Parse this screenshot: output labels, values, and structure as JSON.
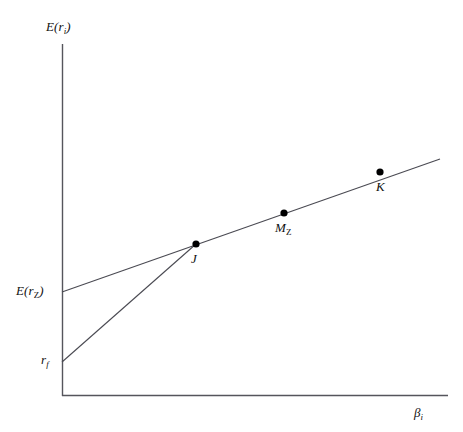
{
  "figure": {
    "background": "#ffffff",
    "line_color": "#4a4a52",
    "axis_color": "#55555c",
    "point_color": "#000000",
    "width": 463,
    "height": 432
  },
  "axes": {
    "y_label": "E(r",
    "y_label_sub": "i",
    "y_label_close": ")",
    "x_label": "β",
    "x_label_sub": "i",
    "origin": {
      "x": 62,
      "y": 396
    },
    "y_top": 44,
    "x_right": 448
  },
  "labels": {
    "erz_main": "E(r",
    "erz_sub": "Z",
    "erz_close": ")",
    "rf_main": "r",
    "rf_sub": "f",
    "point_j": "J",
    "point_mz_main": "M",
    "point_mz_sub": "Z",
    "point_k": "K"
  },
  "chart_data": {
    "type": "line",
    "title": "",
    "xlabel": "βi",
    "ylabel": "E(ri)",
    "grid": false,
    "legend": null,
    "xlim": [
      62,
      448
    ],
    "ylim": [
      396,
      44
    ],
    "series": [
      {
        "name": "zero-beta-security-market-line",
        "comment": "Security market line drawn from the zero-beta return E(rZ) on the vertical axis, passing through J, MZ and K",
        "points": [
          {
            "x": 62,
            "y": 292,
            "label": "E(rZ) intercept"
          },
          {
            "x": 196,
            "y": 244,
            "label": "J"
          },
          {
            "x": 284,
            "y": 213,
            "label": "MZ"
          },
          {
            "x": 380,
            "y": 172,
            "label": "K"
          },
          {
            "x": 440,
            "y": 159,
            "label": "line end"
          }
        ]
      },
      {
        "name": "risk-free-capital-market-line",
        "comment": "Line from the risk free rate rf on the vertical axis up to the tangency point J",
        "points": [
          {
            "x": 62,
            "y": 362,
            "label": "rf intercept"
          },
          {
            "x": 196,
            "y": 244,
            "label": "J"
          }
        ]
      }
    ],
    "markers": [
      {
        "name": "J",
        "x": 196,
        "y": 244,
        "radius": 3.6
      },
      {
        "name": "MZ",
        "x": 284,
        "y": 213,
        "radius": 3.6
      },
      {
        "name": "K",
        "x": 380,
        "y": 172,
        "radius": 3.6
      }
    ],
    "annotations": [
      {
        "text": "E(rZ)",
        "x": 16,
        "y": 284,
        "anchor": "y-axis-intercept"
      },
      {
        "text": "rf",
        "x": 41,
        "y": 353,
        "anchor": "y-axis-intercept"
      },
      {
        "text": "J",
        "x": 191,
        "y": 252,
        "anchor": "below-point"
      },
      {
        "text": "MZ",
        "x": 275,
        "y": 221,
        "anchor": "below-point"
      },
      {
        "text": "K",
        "x": 376,
        "y": 180,
        "anchor": "below-point"
      }
    ]
  }
}
